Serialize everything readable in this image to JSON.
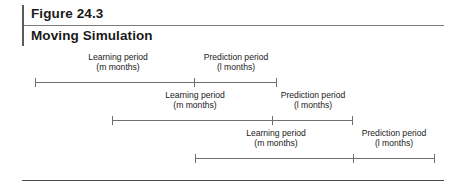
{
  "figure": {
    "number": "Figure 24.3",
    "title": "Moving Simulation"
  },
  "colors": {
    "text": "#1a1a1a",
    "rule": "#6e6e6e",
    "header_bar": "#5b5b5b",
    "background": "#ffffff"
  },
  "labels": {
    "learning_title": "Learning period",
    "learning_sub": "(m months)",
    "prediction_title": "Prediction period",
    "prediction_sub": "(l months)"
  },
  "rows": [
    {
      "name": "timeline-row-1",
      "line_y": 82,
      "start_x": 35,
      "split_x": 194,
      "end_x": 276,
      "learning_label_center": 118,
      "prediction_label_center": 236,
      "label_top": 52
    },
    {
      "name": "timeline-row-2",
      "line_y": 120,
      "start_x": 112,
      "split_x": 272,
      "end_x": 352,
      "learning_label_center": 195,
      "prediction_label_center": 313,
      "label_top": 90
    },
    {
      "name": "timeline-row-3",
      "line_y": 158,
      "start_x": 195,
      "split_x": 353,
      "end_x": 434,
      "learning_label_center": 276,
      "prediction_label_center": 394,
      "label_top": 128
    }
  ]
}
